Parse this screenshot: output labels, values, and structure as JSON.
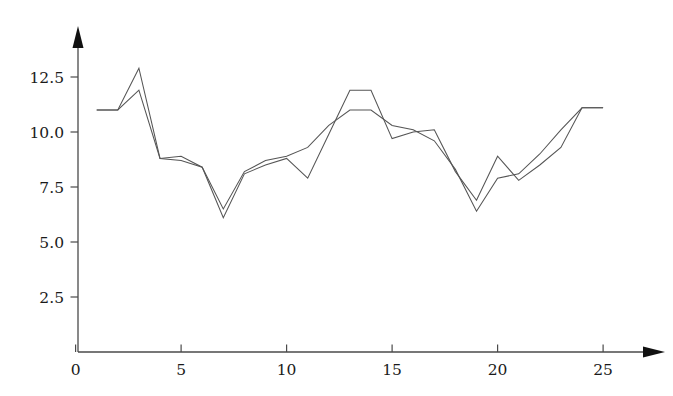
{
  "chart_data": {
    "type": "line",
    "title": "",
    "subtitle": "",
    "xlabel": "",
    "ylabel": "",
    "xlim": [
      0,
      26.5
    ],
    "ylim": [
      0,
      14.2
    ],
    "xticks": [
      0,
      5,
      10,
      15,
      20,
      25
    ],
    "xtick_labels": [
      "0",
      "5",
      "10",
      "15",
      "20",
      "25"
    ],
    "yticks": [
      2.5,
      5.0,
      7.5,
      10.0,
      12.5
    ],
    "ytick_labels": [
      "2.5",
      "5.0",
      "7.5",
      "10.0",
      "12.5"
    ],
    "grid": false,
    "legend": "none",
    "axis_style": "arrow-spine",
    "line_color": "#555555",
    "x": [
      1,
      2,
      3,
      4,
      5,
      6,
      7,
      8,
      9,
      10,
      11,
      12,
      13,
      14,
      15,
      16,
      17,
      18,
      19,
      20,
      21,
      22,
      23,
      24,
      25
    ],
    "series": [
      {
        "name": "series-1",
        "values": [
          11.0,
          11.0,
          12.9,
          8.8,
          8.9,
          8.4,
          6.1,
          8.1,
          8.5,
          8.8,
          7.9,
          9.9,
          11.9,
          11.9,
          9.7,
          10.0,
          10.1,
          8.2,
          6.9,
          8.9,
          7.8,
          8.5,
          9.3,
          11.1,
          11.1
        ]
      },
      {
        "name": "series-2",
        "values": [
          11.0,
          11.0,
          11.9,
          8.8,
          8.7,
          8.4,
          6.5,
          8.2,
          8.7,
          8.9,
          9.3,
          10.3,
          11.0,
          11.0,
          10.3,
          10.1,
          9.6,
          8.3,
          6.4,
          7.9,
          8.1,
          9.0,
          10.1,
          11.1,
          11.1
        ]
      }
    ]
  }
}
